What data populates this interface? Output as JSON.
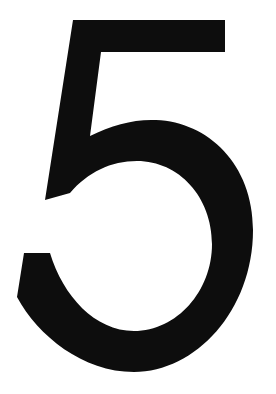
{
  "image": {
    "kind": "single-glyph-image",
    "subject": "numeral-five",
    "character": "5",
    "reading": "five",
    "description": "Large black numeral 5 centered on a plain white background",
    "width": 276,
    "height": 394,
    "background_color": "#ffffff",
    "ink_color": "#0d0d0d",
    "style": "sans-serif bold, slightly slanted stem, open lower-left terminal",
    "alt_text": "5"
  },
  "glyph": {
    "name": "digit-five",
    "label": "5",
    "fill": "#0d0d0d",
    "bounds": {
      "left": 17,
      "top": 20,
      "right": 253,
      "bottom": 372
    },
    "parts": [
      {
        "name": "top-bar",
        "label": "Top horizontal bar",
        "left": 73,
        "top": 20,
        "right": 225,
        "bottom": 52
      },
      {
        "name": "vertical-stem",
        "label": "Descending slanted stem",
        "top": 52,
        "bottom": 200,
        "top_left": 73,
        "bottom_left": 45
      },
      {
        "name": "bowl",
        "label": "Lower round bowl",
        "outer_left": 17,
        "outer_top": 138,
        "outer_right": 253,
        "outer_bottom": 372,
        "counter_left": 60,
        "counter_top": 160,
        "counter_right": 220,
        "counter_bottom": 336
      },
      {
        "name": "lower-left-terminal",
        "label": "Open lower-left terminal cut",
        "left": 24,
        "top": 253,
        "right": 50
      }
    ],
    "path": "M 73 20 L 225 20 L 225 52 L 101 52 L 90 136 C 112 125 134 119 156 120 C 208 122 253 164 253 230 C 253 311 195 372 134 372 C 83 372 38 336 17 297 L 24 253 L 50 253 C 63 296 95 331 134 331 C 177 331 212 291 212 244 C 212 197 179 161 137 161 C 111 161 88 172 70 193 L 45 200 L 73 20 Z"
  }
}
